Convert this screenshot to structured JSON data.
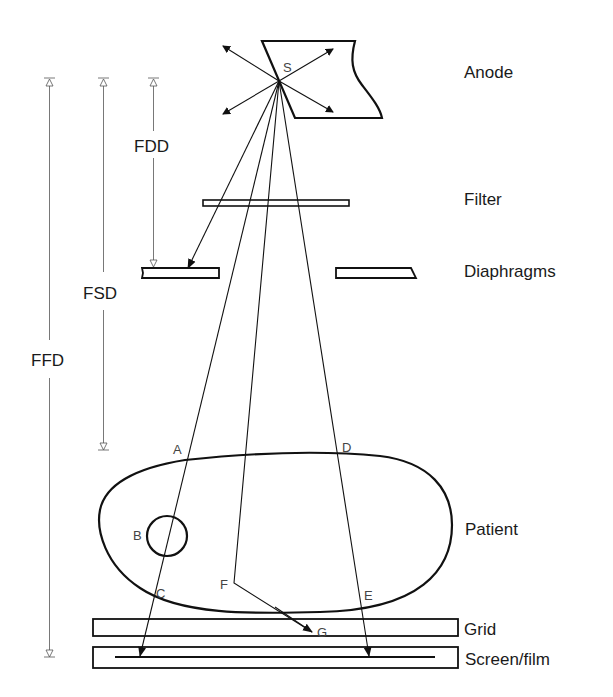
{
  "components": {
    "anode": "Anode",
    "filter": "Filter",
    "diaphragms": "Diaphragms",
    "patient": "Patient",
    "grid": "Grid",
    "screen_film": "Screen/film"
  },
  "dimensions": {
    "fdd": "FDD",
    "fsd": "FSD",
    "ffd": "FFD"
  },
  "points": {
    "s": "S",
    "a": "A",
    "b": "B",
    "c": "C",
    "d": "D",
    "e": "E",
    "f": "F",
    "g": "G"
  },
  "colors": {
    "line": "#111111",
    "dimension": "#555555",
    "background": "#ffffff"
  }
}
